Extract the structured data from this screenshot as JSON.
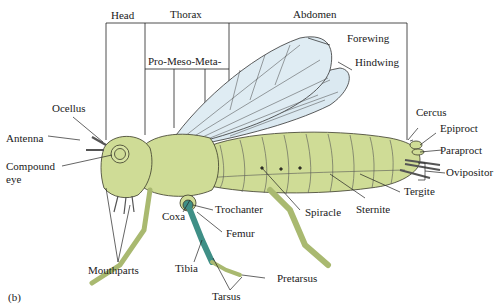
{
  "figure": {
    "panel_label": "(b)",
    "colors": {
      "body": "#cfdc96",
      "body_dark": "#a9b970",
      "wing": "#dbe9f1",
      "leg_highlight": "#3f8f86",
      "line": "#1a1a1a"
    },
    "regions": {
      "head": "Head",
      "thorax": "Thorax",
      "abdomen": "Abdomen",
      "thorax_segments": "Pro-Meso-Meta-"
    },
    "labels": {
      "forewing": "Forewing",
      "hindwing": "Hindwing",
      "ocellus": "Ocellus",
      "antenna": "Antenna",
      "compound_eye_1": "Compound",
      "compound_eye_2": "eye",
      "cercus": "Cercus",
      "epiproct": "Epiproct",
      "paraproct": "Paraproct",
      "ovipositor": "Ovipositor",
      "tergite": "Tergite",
      "sternite": "Sternite",
      "spiracle": "Spiracle",
      "coxa": "Coxa",
      "trochanter": "Trochanter",
      "femur": "Femur",
      "tibia": "Tibia",
      "tarsus": "Tarsus",
      "pretarsus": "Pretarsus",
      "mouthparts": "Mouthparts"
    }
  }
}
